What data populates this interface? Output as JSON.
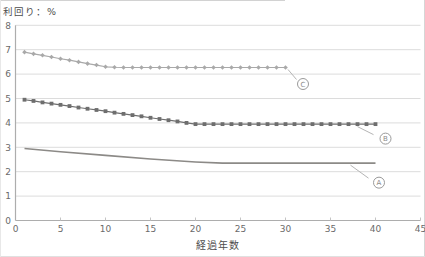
{
  "chart_data": {
    "type": "line",
    "title": "利回り：%",
    "xlabel": "経過年数",
    "ylabel": "利回り：%",
    "xlim": [
      0,
      45
    ],
    "ylim": [
      0,
      8
    ],
    "x_ticks": [
      0,
      5,
      10,
      15,
      20,
      25,
      30,
      35,
      40,
      45
    ],
    "y_ticks": [
      0,
      1,
      2,
      3,
      4,
      5,
      6,
      7,
      8
    ],
    "grid": "horizontal-only",
    "legend": "circled-callouts-near-line-ends",
    "colors": {
      "gridline": "#dcdcdc",
      "axis": "#adadad",
      "tick_text": "#6a6a6a",
      "callout": "#9a9a9a"
    },
    "series": [
      {
        "name": "A",
        "marker": "none",
        "color": "#8c8a87",
        "line_width": 1.6,
        "x": [
          1,
          5,
          10,
          15,
          20,
          23,
          25,
          30,
          35,
          40
        ],
        "y": [
          2.95,
          2.82,
          2.67,
          2.52,
          2.4,
          2.35,
          2.35,
          2.35,
          2.35,
          2.35
        ]
      },
      {
        "name": "B",
        "marker": "square",
        "color": "#6e6e6e",
        "line_width": 1.2,
        "x": [
          1,
          2,
          3,
          4,
          5,
          6,
          7,
          8,
          9,
          10,
          11,
          12,
          13,
          14,
          15,
          16,
          17,
          18,
          19,
          20,
          21,
          22,
          23,
          24,
          25,
          26,
          27,
          28,
          29,
          30,
          31,
          32,
          33,
          34,
          35,
          36,
          37,
          38,
          39,
          40
        ],
        "y": [
          4.95,
          4.9,
          4.84,
          4.79,
          4.74,
          4.69,
          4.63,
          4.58,
          4.53,
          4.48,
          4.42,
          4.37,
          4.32,
          4.27,
          4.21,
          4.16,
          4.11,
          4.06,
          4.0,
          3.95,
          3.95,
          3.95,
          3.95,
          3.95,
          3.95,
          3.95,
          3.95,
          3.95,
          3.95,
          3.95,
          3.95,
          3.95,
          3.95,
          3.95,
          3.95,
          3.95,
          3.95,
          3.95,
          3.95,
          3.95
        ]
      },
      {
        "name": "C",
        "marker": "diamond",
        "color": "#a9a9a9",
        "line_width": 1.2,
        "x": [
          1,
          2,
          3,
          4,
          5,
          6,
          7,
          8,
          9,
          10,
          11,
          12,
          13,
          14,
          15,
          16,
          17,
          18,
          19,
          20,
          21,
          22,
          23,
          24,
          25,
          26,
          27,
          28,
          29,
          30
        ],
        "y": [
          6.9,
          6.83,
          6.77,
          6.7,
          6.63,
          6.57,
          6.5,
          6.43,
          6.37,
          6.3,
          6.28,
          6.27,
          6.27,
          6.27,
          6.27,
          6.27,
          6.27,
          6.27,
          6.27,
          6.27,
          6.27,
          6.27,
          6.27,
          6.27,
          6.27,
          6.27,
          6.27,
          6.27,
          6.27,
          6.27
        ]
      }
    ],
    "callouts": [
      {
        "series": "A",
        "label": "A",
        "center": [
          3.5,
          19.5
        ],
        "leader": [
          -25,
          2,
          -7,
          15
        ]
      },
      {
        "series": "B",
        "label": "B",
        "center": [
          10,
          14.5
        ],
        "leader": [
          -18,
          2.5,
          -2,
          10.5
        ]
      },
      {
        "series": "C",
        "label": "C",
        "center": [
          17.5,
          16.5
        ],
        "leader": [
          2.5,
          2,
          11,
          12
        ]
      }
    ]
  }
}
